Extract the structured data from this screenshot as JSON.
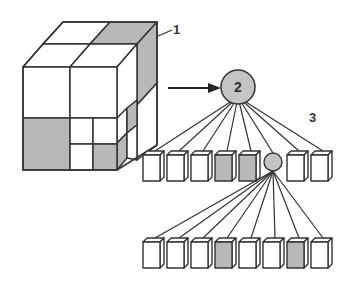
{
  "diagram": {
    "labels": {
      "cube": "1",
      "root_node": "2",
      "tree": "3"
    },
    "colors": {
      "stroke": "#333333",
      "shaded": "#b8b8b8",
      "empty": "#ffffff",
      "node_fill": "#c4c4c4"
    },
    "tree": {
      "root": {
        "label": "2",
        "cx": 238,
        "cy": 87,
        "r": 17
      },
      "level1": {
        "children": [
          {
            "type": "leaf",
            "filled": false
          },
          {
            "type": "leaf",
            "filled": false
          },
          {
            "type": "leaf",
            "filled": false
          },
          {
            "type": "leaf",
            "filled": true
          },
          {
            "type": "leaf",
            "filled": true
          },
          {
            "type": "node",
            "filled": true
          },
          {
            "type": "leaf",
            "filled": false
          },
          {
            "type": "leaf",
            "filled": false
          }
        ]
      },
      "level2": {
        "children": [
          {
            "type": "leaf",
            "filled": false
          },
          {
            "type": "leaf",
            "filled": false
          },
          {
            "type": "leaf",
            "filled": false
          },
          {
            "type": "leaf",
            "filled": true
          },
          {
            "type": "leaf",
            "filled": false
          },
          {
            "type": "leaf",
            "filled": false
          },
          {
            "type": "leaf",
            "filled": true
          },
          {
            "type": "leaf",
            "filled": false
          }
        ]
      }
    }
  }
}
